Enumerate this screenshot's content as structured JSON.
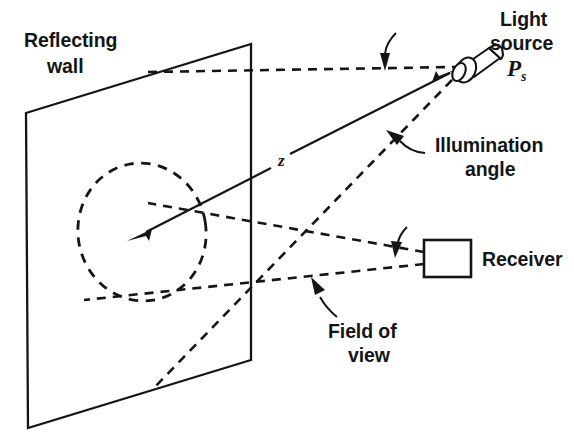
{
  "figure": {
    "background_color": "#ffffff",
    "ink_color": "#151515",
    "labels": {
      "reflecting_wall_line1": "Reflecting",
      "reflecting_wall_line2": "wall",
      "light_source_line1": "Light",
      "light_source_line2": "source",
      "light_source_symbol": "P",
      "light_source_subscript": "s",
      "illumination_angle_line1": "Illumination",
      "illumination_angle_line2": "angle",
      "receiver": "Receiver",
      "field_of_view_line1": "Field of",
      "field_of_view_line2": "view",
      "distance_symbol": "z"
    },
    "elements": {
      "wall": "reflecting-wall-parallelogram",
      "spot": "dashed-illumination-ellipse",
      "lamp": "light-source-lamp",
      "receiver_box": "receiver-box",
      "range_arrow": "range-vector-z",
      "horizontal_reference": "horizontal-dashed-reference-line",
      "illumination_ray": "illumination-dashed-ray",
      "fov_upper": "field-of-view-upper-dashed-ray",
      "fov_lower": "field-of-view-lower-dashed-ray",
      "angle_pointer_top": "curved-arrow-to-incidence-angle",
      "angle_pointer_illum": "curved-arrow-to-illumination-angle",
      "angle_pointer_fov_upper": "curved-arrow-to-field-of-view-upper",
      "angle_pointer_fov_lower": "curved-arrow-to-field-of-view-lower"
    }
  }
}
